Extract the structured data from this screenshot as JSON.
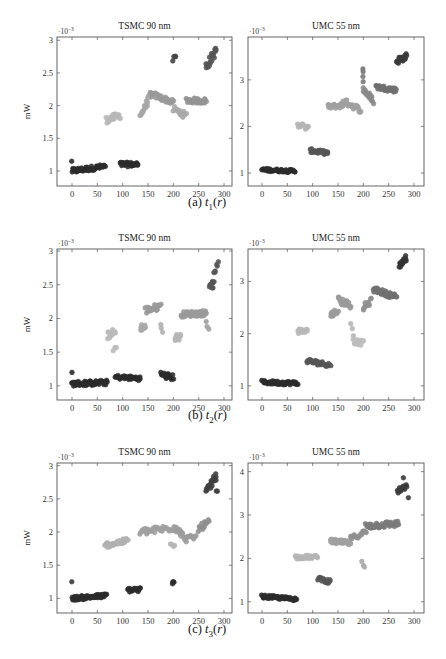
{
  "figure": {
    "subfigures": [
      {
        "label": "(a)",
        "var": "t",
        "sub": "1",
        "arg": "r",
        "caption_x": 188,
        "caption_y": 202
      },
      {
        "label": "(b)",
        "var": "t",
        "sub": "2",
        "arg": "r",
        "caption_x": 188,
        "caption_y": 414
      },
      {
        "label": "(c)",
        "var": "t",
        "sub": "3",
        "arg": "r",
        "caption_x": 188,
        "caption_y": 627
      }
    ]
  },
  "chart_data": [
    {
      "type": "scatter",
      "title": "TSMC 90 nm",
      "subfigure": "(a) t1(r)",
      "ylabel": "mW",
      "xlabel": "",
      "y_scale_note": "·10^-3",
      "xlim": [
        -30,
        310
      ],
      "ylim": [
        0.77,
        3.05
      ],
      "xticks": [
        0,
        50,
        100,
        150,
        200,
        250,
        300
      ],
      "yticks": [
        1,
        1.5,
        2,
        2.5,
        3
      ],
      "ytick_labels": [
        "1",
        "1.5",
        "2",
        "2.5",
        "3"
      ],
      "box": {
        "x0": 57,
        "x1": 232,
        "y0": 37,
        "y1": 186,
        "px_x0": 72,
        "px_x300": 224
      },
      "clusters": [
        {
          "x": [
            0,
            65
          ],
          "y": [
            1.0,
            1.07
          ],
          "spread": 0.035,
          "shade": "#2b2b2b",
          "n": 48,
          "trend": 0.04
        },
        {
          "x": [
            0,
            0
          ],
          "y": [
            1.15,
            1.15
          ],
          "spread": 0,
          "shade": "#2b2b2b",
          "n": 1
        },
        {
          "x": [
            95,
            130
          ],
          "y": [
            1.1,
            1.1
          ],
          "spread": 0.035,
          "shade": "#2b2b2b",
          "n": 28
        },
        {
          "x": [
            68,
            95
          ],
          "y": [
            1.78,
            1.85
          ],
          "spread": 0.05,
          "shade": "#b8b8b8",
          "n": 20
        },
        {
          "x": [
            135,
            155
          ],
          "y": [
            1.85,
            2.15
          ],
          "spread": 0.05,
          "shade": "#a6a6a6",
          "n": 18
        },
        {
          "x": [
            155,
            200
          ],
          "y": [
            2.18,
            2.05
          ],
          "spread": 0.04,
          "shade": "#9a9a9a",
          "n": 32
        },
        {
          "x": [
            200,
            225
          ],
          "y": [
            1.95,
            1.85
          ],
          "spread": 0.05,
          "shade": "#a9a9a9",
          "n": 14
        },
        {
          "x": [
            225,
            265
          ],
          "y": [
            2.08,
            2.07
          ],
          "spread": 0.04,
          "shade": "#949494",
          "n": 28
        },
        {
          "x": [
            200,
            205
          ],
          "y": [
            2.72,
            2.75
          ],
          "spread": 0.05,
          "shade": "#444444",
          "n": 4
        },
        {
          "x": [
            265,
            285
          ],
          "y": [
            2.6,
            2.85
          ],
          "spread": 0.07,
          "shade": "#555555",
          "n": 20
        }
      ]
    },
    {
      "type": "scatter",
      "title": "UMC 55 nm",
      "subfigure": "(a) t1(r)",
      "ylabel": "",
      "xlabel": "",
      "y_scale_note": "·10^-3",
      "xlim": [
        -30,
        310
      ],
      "ylim": [
        0.72,
        3.92
      ],
      "xticks": [
        0,
        50,
        100,
        150,
        200,
        250,
        300
      ],
      "yticks": [
        1,
        2,
        3
      ],
      "ytick_labels": [
        "1",
        "2",
        "3"
      ],
      "box": {
        "x0": 248,
        "x1": 424,
        "y0": 37,
        "y1": 186,
        "px_x0": 262,
        "px_x300": 414
      },
      "clusters": [
        {
          "x": [
            0,
            65
          ],
          "y": [
            1.07,
            1.04
          ],
          "spread": 0.03,
          "shade": "#2b2b2b",
          "n": 48
        },
        {
          "x": [
            70,
            92
          ],
          "y": [
            2.05,
            1.95
          ],
          "spread": 0.06,
          "shade": "#b5b5b5",
          "n": 14
        },
        {
          "x": [
            95,
            130
          ],
          "y": [
            1.48,
            1.43
          ],
          "spread": 0.04,
          "shade": "#555555",
          "n": 30
        },
        {
          "x": [
            130,
            160
          ],
          "y": [
            2.42,
            2.45
          ],
          "spread": 0.05,
          "shade": "#a0a0a0",
          "n": 22
        },
        {
          "x": [
            160,
            195
          ],
          "y": [
            2.55,
            2.35
          ],
          "spread": 0.06,
          "shade": "#a0a0a0",
          "n": 26
        },
        {
          "x": [
            200,
            200
          ],
          "y": [
            3.2,
            3.0
          ],
          "spread": 0.06,
          "shade": "#7a7a7a",
          "n": 4
        },
        {
          "x": [
            200,
            220
          ],
          "y": [
            2.8,
            2.55
          ],
          "spread": 0.07,
          "shade": "#8a8a8a",
          "n": 18
        },
        {
          "x": [
            225,
            265
          ],
          "y": [
            2.85,
            2.78
          ],
          "spread": 0.05,
          "shade": "#707070",
          "n": 30
        },
        {
          "x": [
            265,
            285
          ],
          "y": [
            3.4,
            3.5
          ],
          "spread": 0.07,
          "shade": "#3b3b3b",
          "n": 20
        }
      ]
    },
    {
      "type": "scatter",
      "title": "TSMC 90 nm",
      "subfigure": "(b) t2(r)",
      "ylabel": "mW",
      "xlabel": "",
      "y_scale_note": "·10^-3",
      "xlim": [
        -30,
        310
      ],
      "ylim": [
        0.79,
        3.03
      ],
      "xticks": [
        0,
        50,
        100,
        150,
        200,
        250,
        300
      ],
      "yticks": [
        1,
        1.5,
        2,
        2.5,
        3
      ],
      "ytick_labels": [
        "1",
        "1.5",
        "2",
        "2.5",
        "3"
      ],
      "box": {
        "x0": 57,
        "x1": 232,
        "y0": 249,
        "y1": 400,
        "px_x0": 72,
        "px_x300": 224
      },
      "clusters": [
        {
          "x": [
            0,
            70
          ],
          "y": [
            1.03,
            1.05
          ],
          "spread": 0.035,
          "shade": "#2b2b2b",
          "n": 52
        },
        {
          "x": [
            0,
            0
          ],
          "y": [
            1.2,
            1.2
          ],
          "spread": 0,
          "shade": "#2b2b2b",
          "n": 1
        },
        {
          "x": [
            85,
            135
          ],
          "y": [
            1.13,
            1.11
          ],
          "spread": 0.03,
          "shade": "#2b2b2b",
          "n": 34
        },
        {
          "x": [
            175,
            200
          ],
          "y": [
            1.17,
            1.12
          ],
          "spread": 0.045,
          "shade": "#2b2b2b",
          "n": 18
        },
        {
          "x": [
            70,
            85
          ],
          "y": [
            1.75,
            1.8
          ],
          "spread": 0.06,
          "shade": "#bababa",
          "n": 14
        },
        {
          "x": [
            82,
            88
          ],
          "y": [
            1.55,
            1.55
          ],
          "spread": 0.04,
          "shade": "#bababa",
          "n": 3
        },
        {
          "x": [
            135,
            145
          ],
          "y": [
            1.87,
            1.87
          ],
          "spread": 0.05,
          "shade": "#a8a8a8",
          "n": 12
        },
        {
          "x": [
            145,
            175
          ],
          "y": [
            2.12,
            2.18
          ],
          "spread": 0.05,
          "shade": "#9a9a9a",
          "n": 22
        },
        {
          "x": [
            175,
            178
          ],
          "y": [
            1.95,
            1.78
          ],
          "spread": 0.04,
          "shade": "#b0b0b0",
          "n": 3
        },
        {
          "x": [
            203,
            215
          ],
          "y": [
            1.72,
            1.72
          ],
          "spread": 0.05,
          "shade": "#b5b5b5",
          "n": 10
        },
        {
          "x": [
            215,
            265
          ],
          "y": [
            2.06,
            2.08
          ],
          "spread": 0.04,
          "shade": "#9a9a9a",
          "n": 40
        },
        {
          "x": [
            265,
            270
          ],
          "y": [
            1.95,
            1.85
          ],
          "spread": 0.03,
          "shade": "#a0a0a0",
          "n": 3
        },
        {
          "x": [
            272,
            280
          ],
          "y": [
            2.5,
            2.5
          ],
          "spread": 0.05,
          "shade": "#555555",
          "n": 10
        },
        {
          "x": [
            280,
            288
          ],
          "y": [
            2.65,
            2.85
          ],
          "spread": 0.04,
          "shade": "#555555",
          "n": 6
        }
      ]
    },
    {
      "type": "scatter",
      "title": "UMC 55 nm",
      "subfigure": "(b) t2(r)",
      "ylabel": "",
      "xlabel": "",
      "y_scale_note": "·10^-3",
      "xlim": [
        -30,
        310
      ],
      "ylim": [
        0.73,
        3.62
      ],
      "xticks": [
        0,
        50,
        100,
        150,
        200,
        250,
        300
      ],
      "yticks": [
        1,
        2,
        3
      ],
      "ytick_labels": [
        "1",
        "2",
        "3"
      ],
      "box": {
        "x0": 248,
        "x1": 424,
        "y0": 249,
        "y1": 400,
        "px_x0": 262,
        "px_x300": 414
      },
      "clusters": [
        {
          "x": [
            0,
            70
          ],
          "y": [
            1.07,
            1.05
          ],
          "spread": 0.035,
          "shade": "#2b2b2b",
          "n": 52
        },
        {
          "x": [
            70,
            90
          ],
          "y": [
            2.05,
            2.05
          ],
          "spread": 0.05,
          "shade": "#b8b8b8",
          "n": 14
        },
        {
          "x": [
            88,
            135
          ],
          "y": [
            1.48,
            1.4
          ],
          "spread": 0.04,
          "shade": "#555555",
          "n": 34
        },
        {
          "x": [
            135,
            150
          ],
          "y": [
            2.35,
            2.45
          ],
          "spread": 0.06,
          "shade": "#9a9a9a",
          "n": 10
        },
        {
          "x": [
            150,
            175
          ],
          "y": [
            2.65,
            2.55
          ],
          "spread": 0.07,
          "shade": "#9a9a9a",
          "n": 18
        },
        {
          "x": [
            175,
            180
          ],
          "y": [
            2.2,
            2.0
          ],
          "spread": 0.04,
          "shade": "#b5b5b5",
          "n": 3
        },
        {
          "x": [
            180,
            200
          ],
          "y": [
            1.85,
            1.82
          ],
          "spread": 0.05,
          "shade": "#bcbcbc",
          "n": 12
        },
        {
          "x": [
            200,
            215
          ],
          "y": [
            2.5,
            2.62
          ],
          "spread": 0.06,
          "shade": "#8f8f8f",
          "n": 12
        },
        {
          "x": [
            220,
            265
          ],
          "y": [
            2.85,
            2.7
          ],
          "spread": 0.05,
          "shade": "#707070",
          "n": 36
        },
        {
          "x": [
            270,
            285
          ],
          "y": [
            3.3,
            3.45
          ],
          "spread": 0.06,
          "shade": "#333333",
          "n": 14
        }
      ]
    },
    {
      "type": "scatter",
      "title": "TSMC 90 nm",
      "subfigure": "(c) t3(r)",
      "ylabel": "mW",
      "xlabel": "",
      "y_scale_note": "·10^-3",
      "xlim": [
        -30,
        310
      ],
      "ylim": [
        0.78,
        3.04
      ],
      "xticks": [
        0,
        50,
        100,
        150,
        200,
        250,
        300
      ],
      "yticks": [
        1,
        1.5,
        2,
        2.5,
        3
      ],
      "ytick_labels": [
        "1",
        "1.5",
        "2",
        "2.5",
        "3"
      ],
      "box": {
        "x0": 57,
        "x1": 232,
        "y0": 463,
        "y1": 613,
        "px_x0": 72,
        "px_x300": 224
      },
      "clusters": [
        {
          "x": [
            0,
            68
          ],
          "y": [
            1.0,
            1.04
          ],
          "spread": 0.03,
          "shade": "#2b2b2b",
          "n": 52
        },
        {
          "x": [
            0,
            0
          ],
          "y": [
            1.25,
            1.25
          ],
          "spread": 0,
          "shade": "#3a3a3a",
          "n": 1
        },
        {
          "x": [
            110,
            135
          ],
          "y": [
            1.13,
            1.13
          ],
          "spread": 0.035,
          "shade": "#2b2b2b",
          "n": 18
        },
        {
          "x": [
            198,
            202
          ],
          "y": [
            1.22,
            1.22
          ],
          "spread": 0.04,
          "shade": "#2b2b2b",
          "n": 4
        },
        {
          "x": [
            65,
            110
          ],
          "y": [
            1.8,
            1.87
          ],
          "spread": 0.04,
          "shade": "#b0b0b0",
          "n": 30
        },
        {
          "x": [
            135,
            205
          ],
          "y": [
            2.0,
            2.07
          ],
          "spread": 0.05,
          "shade": "#a0a0a0",
          "n": 44
        },
        {
          "x": [
            195,
            202
          ],
          "y": [
            1.85,
            1.8
          ],
          "spread": 0.04,
          "shade": "#b5b5b5",
          "n": 4
        },
        {
          "x": [
            205,
            225
          ],
          "y": [
            2.05,
            1.9
          ],
          "spread": 0.05,
          "shade": "#9c9c9c",
          "n": 14
        },
        {
          "x": [
            225,
            245
          ],
          "y": [
            1.9,
            1.92
          ],
          "spread": 0.04,
          "shade": "#9c9c9c",
          "n": 10
        },
        {
          "x": [
            250,
            270
          ],
          "y": [
            2.05,
            2.15
          ],
          "spread": 0.05,
          "shade": "#8f8f8f",
          "n": 14
        },
        {
          "x": [
            265,
            285
          ],
          "y": [
            2.6,
            2.85
          ],
          "spread": 0.06,
          "shade": "#404040",
          "n": 22
        },
        {
          "x": [
            285,
            287
          ],
          "y": [
            2.6,
            2.62
          ],
          "spread": 0.02,
          "shade": "#404040",
          "n": 2
        }
      ]
    },
    {
      "type": "scatter",
      "title": "UMC 55 nm",
      "subfigure": "(c) t3(r)",
      "ylabel": "",
      "xlabel": "",
      "y_scale_note": "·10^-3",
      "xlim": [
        -30,
        310
      ],
      "ylim": [
        0.74,
        4.2
      ],
      "xticks": [
        0,
        50,
        100,
        150,
        200,
        250,
        300
      ],
      "yticks": [
        1,
        2,
        3,
        4
      ],
      "ytick_labels": [
        "1",
        "2",
        "3",
        "4"
      ],
      "box": {
        "x0": 248,
        "x1": 424,
        "y0": 463,
        "y1": 613,
        "px_x0": 262,
        "px_x300": 414
      },
      "clusters": [
        {
          "x": [
            0,
            68
          ],
          "y": [
            1.12,
            1.06
          ],
          "spread": 0.035,
          "shade": "#2b2b2b",
          "n": 52
        },
        {
          "x": [
            65,
            110
          ],
          "y": [
            2.03,
            2.03
          ],
          "spread": 0.04,
          "shade": "#b5b5b5",
          "n": 30
        },
        {
          "x": [
            110,
            135
          ],
          "y": [
            1.55,
            1.45
          ],
          "spread": 0.05,
          "shade": "#555555",
          "n": 16
        },
        {
          "x": [
            135,
            175
          ],
          "y": [
            2.4,
            2.35
          ],
          "spread": 0.05,
          "shade": "#a0a0a0",
          "n": 36
        },
        {
          "x": [
            175,
            205
          ],
          "y": [
            2.45,
            2.62
          ],
          "spread": 0.06,
          "shade": "#909090",
          "n": 18
        },
        {
          "x": [
            197,
            202
          ],
          "y": [
            1.9,
            1.8
          ],
          "spread": 0.04,
          "shade": "#aaaaaa",
          "n": 3
        },
        {
          "x": [
            205,
            270
          ],
          "y": [
            2.75,
            2.8
          ],
          "spread": 0.07,
          "shade": "#7a7a7a",
          "n": 44
        },
        {
          "x": [
            268,
            285
          ],
          "y": [
            3.55,
            3.65
          ],
          "spread": 0.06,
          "shade": "#3a3a3a",
          "n": 16
        },
        {
          "x": [
            280,
            288
          ],
          "y": [
            3.85,
            3.38
          ],
          "spread": 0.02,
          "shade": "#3a3a3a",
          "n": 2
        }
      ]
    }
  ]
}
